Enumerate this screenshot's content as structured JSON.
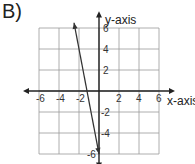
{
  "problem_label": "B)",
  "chart_data": {
    "type": "line",
    "title": "",
    "xlabel": "x-axis",
    "ylabel": "y-axis",
    "xlim": [
      -7,
      7
    ],
    "ylim": [
      -7,
      7
    ],
    "grid": true,
    "x_ticks": [
      -6,
      -4,
      -2,
      2,
      4,
      6
    ],
    "y_ticks": [
      6,
      4,
      2,
      -2,
      -4,
      -6
    ],
    "x_tick_labels": [
      "-6",
      "-4",
      "-2",
      "2",
      "4",
      "6"
    ],
    "y_tick_labels": [
      "6",
      "4",
      "2",
      "-2",
      "-4",
      "-6"
    ],
    "series": [
      {
        "name": "line",
        "equation_estimate": "y = -5x - 6",
        "x": [
          -2.5,
          0
        ],
        "y": [
          6.5,
          -6
        ],
        "arrows_both_ends": true
      }
    ]
  }
}
